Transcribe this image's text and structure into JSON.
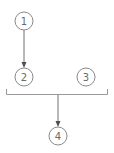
{
  "diagram": {
    "nodes": [
      {
        "id": "1",
        "label": "1",
        "cx": 24,
        "cy": 21,
        "r": 9
      },
      {
        "id": "2",
        "label": "2",
        "cx": 24,
        "cy": 77,
        "r": 9
      },
      {
        "id": "3",
        "label": "3",
        "cx": 86,
        "cy": 77,
        "r": 9
      },
      {
        "id": "4",
        "label": "4",
        "cx": 58,
        "cy": 136,
        "r": 9
      }
    ],
    "edges": [
      {
        "from": "1",
        "to": "2",
        "type": "arrow"
      },
      {
        "from": "group-2-3",
        "to": "4",
        "type": "arrow"
      }
    ],
    "groups": [
      {
        "id": "group-2-3",
        "members": [
          "2",
          "3"
        ],
        "style": "bracket"
      }
    ],
    "colors": {
      "stroke": "#8a8a8a",
      "label": "#6a6a6a",
      "arrow": "#505050",
      "background": "#ffffff"
    }
  }
}
